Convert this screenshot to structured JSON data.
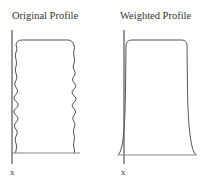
{
  "panels": [
    {
      "id": "original",
      "title": "Original Profile",
      "axis_label": "x",
      "shape": "wavy-sided rectangle"
    },
    {
      "id": "weighted",
      "title": "Weighted Profile",
      "axis_label": "x",
      "shape": "smooth rectangle with flared base"
    }
  ],
  "colors": {
    "line": "#555555",
    "axis": "#333333",
    "text": "#333333",
    "background": "#ffffff"
  }
}
